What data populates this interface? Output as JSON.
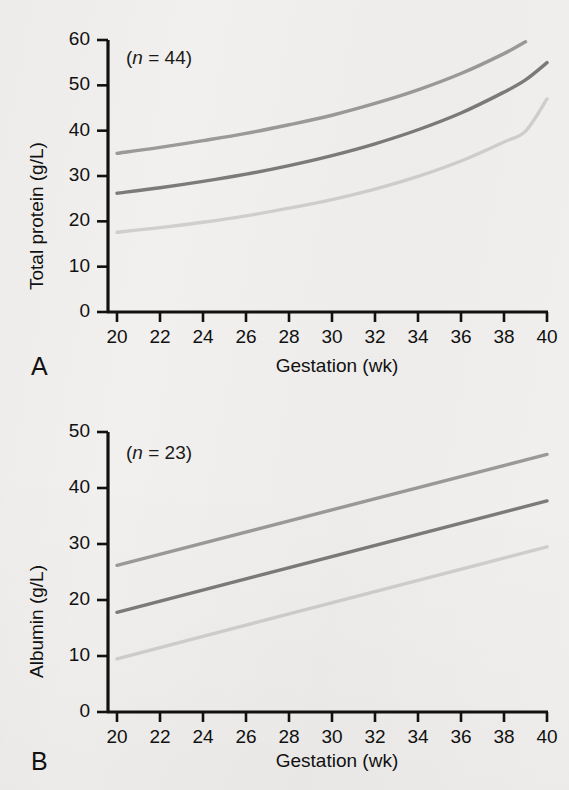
{
  "figure": {
    "background_color": "#f1f0ee",
    "axis_color": "#111111",
    "panels": [
      {
        "letter": "A",
        "annotation_prefix": "(",
        "annotation_var": "n",
        "annotation_eq": " = ",
        "annotation_value": "44",
        "annotation_suffix": ")"
      },
      {
        "letter": "B",
        "annotation_prefix": "(",
        "annotation_var": "n",
        "annotation_eq": " = ",
        "annotation_value": "23",
        "annotation_suffix": ")"
      }
    ]
  },
  "panel_a": {
    "letter": "A",
    "annotation": "(n = 44)",
    "annotation_n": "n",
    "annotation_rest": " = 44)",
    "annotation_open": "(",
    "ylabel": "Total protein (g/L)",
    "xlabel": "Gestation (wk)",
    "yticks": [
      "60",
      "50",
      "40",
      "30",
      "20",
      "10",
      "0"
    ],
    "xticks": [
      "20",
      "22",
      "24",
      "26",
      "28",
      "30",
      "32",
      "34",
      "36",
      "38",
      "40"
    ]
  },
  "panel_b": {
    "letter": "B",
    "annotation": "(n = 23)",
    "annotation_n": "n",
    "annotation_rest": " = 23)",
    "annotation_open": "(",
    "ylabel": "Albumin (g/L)",
    "xlabel": "Gestation (wk)",
    "yticks": [
      "50",
      "40",
      "30",
      "20",
      "10",
      "0"
    ],
    "xticks": [
      "20",
      "22",
      "24",
      "26",
      "28",
      "30",
      "32",
      "34",
      "36",
      "38",
      "40"
    ]
  },
  "chart_data": [
    {
      "type": "line",
      "panel": "A",
      "title": "Total protein versus gestation",
      "annotation": "(n = 44)",
      "xlabel": "Gestation (wk)",
      "ylabel": "Total protein (g/L)",
      "xlim": [
        20,
        40
      ],
      "ylim": [
        0,
        60
      ],
      "xticks": [
        20,
        22,
        24,
        26,
        28,
        30,
        32,
        34,
        36,
        38,
        40
      ],
      "yticks": [
        0,
        10,
        20,
        30,
        40,
        50,
        60
      ],
      "grid": false,
      "legend": "none",
      "x": [
        20,
        22,
        24,
        26,
        28,
        30,
        32,
        34,
        36,
        38,
        39,
        40
      ],
      "series": [
        {
          "name": "upper reference limit",
          "color": "#9a9a9a",
          "values": [
            35.0,
            36.3,
            37.8,
            39.4,
            41.3,
            43.4,
            46.0,
            49.0,
            52.6,
            57.0,
            59.6,
            null
          ]
        },
        {
          "name": "median",
          "color": "#7b7b7b",
          "values": [
            26.2,
            27.4,
            28.8,
            30.4,
            32.3,
            34.5,
            37.1,
            40.2,
            43.9,
            48.5,
            51.2,
            55.0
          ]
        },
        {
          "name": "lower reference limit",
          "color": "#cfcfcf",
          "values": [
            17.6,
            18.6,
            19.8,
            21.2,
            22.9,
            24.8,
            27.1,
            29.9,
            33.3,
            37.5,
            39.9,
            47.0
          ]
        }
      ]
    },
    {
      "type": "line",
      "panel": "B",
      "title": "Albumin versus gestation",
      "annotation": "(n = 23)",
      "xlabel": "Gestation (wk)",
      "ylabel": "Albumin (g/L)",
      "xlim": [
        20,
        40
      ],
      "ylim": [
        0,
        50
      ],
      "xticks": [
        20,
        22,
        24,
        26,
        28,
        30,
        32,
        34,
        36,
        38,
        40
      ],
      "yticks": [
        0,
        10,
        20,
        30,
        40,
        50
      ],
      "grid": false,
      "legend": "none",
      "x": [
        20,
        40
      ],
      "series": [
        {
          "name": "upper reference limit",
          "color": "#9a9a9a",
          "values": [
            26.2,
            46.0
          ]
        },
        {
          "name": "median",
          "color": "#7b7b7b",
          "values": [
            17.8,
            37.7
          ]
        },
        {
          "name": "lower reference limit",
          "color": "#cfcfcf",
          "values": [
            9.5,
            29.5
          ]
        }
      ]
    }
  ]
}
